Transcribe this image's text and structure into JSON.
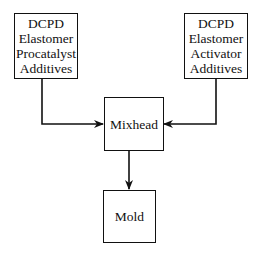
{
  "diagram": {
    "type": "flowchart",
    "nodes": {
      "procatalyst": {
        "lines": [
          "DCPD",
          "Elastomer",
          "Procatalyst",
          "Additives"
        ]
      },
      "activator": {
        "lines": [
          "DCPD",
          "Elastomer",
          "Activator",
          "Additives"
        ]
      },
      "mixhead": {
        "label": "Mixhead"
      },
      "mold": {
        "label": "Mold"
      }
    },
    "edges": [
      {
        "from": "procatalyst",
        "to": "mixhead"
      },
      {
        "from": "activator",
        "to": "mixhead"
      },
      {
        "from": "mixhead",
        "to": "mold"
      }
    ],
    "colors": {
      "stroke": "#111111",
      "background": "#ffffff"
    }
  }
}
